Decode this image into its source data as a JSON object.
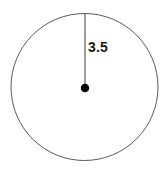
{
  "figure": {
    "kind": "geometry-diagram",
    "background_color": "#ffffff",
    "canvas": {
      "width": 167,
      "height": 171
    }
  },
  "circle": {
    "name": "circle-outline",
    "center": {
      "x": 84.5,
      "y": 87
    },
    "radius": 73.5,
    "stroke_color": "#5a5a5a",
    "stroke_width": 1,
    "fill": "none"
  },
  "center_point": {
    "name": "center-dot",
    "x": 85,
    "y": 88,
    "diameter": 8.5,
    "fill_color": "#000000"
  },
  "radius_segment": {
    "name": "radius-line",
    "from": {
      "x": 85,
      "y": 88
    },
    "to": {
      "x": 85,
      "y": 13.5
    },
    "stroke_color": "#3b3b3b",
    "stroke_width": 1,
    "orientation": "vertical-up"
  },
  "labels": {
    "radius": {
      "text": "3.5",
      "value": 3.5,
      "color": "#1a1a1a",
      "font_size_px": 14,
      "position": {
        "x": 89,
        "y": 48
      }
    }
  },
  "chart_data": {
    "type": "scatter",
    "title": "",
    "xlabel": "",
    "ylabel": "",
    "grid": false,
    "legend_position": "none",
    "annotations": [
      {
        "label": "3.5",
        "kind": "radius-measure",
        "value": 3.5
      }
    ],
    "shapes": [
      {
        "shape": "circle",
        "center_x": 84.5,
        "center_y": 87,
        "radius_px": 73.5,
        "radius_label": "3.5",
        "radius_value": 3.5
      },
      {
        "shape": "segment",
        "x1": 85,
        "y1": 88,
        "x2": 85,
        "y2": 13.5,
        "label": "3.5"
      },
      {
        "shape": "point",
        "x": 85,
        "y": 88,
        "role": "center"
      }
    ]
  }
}
